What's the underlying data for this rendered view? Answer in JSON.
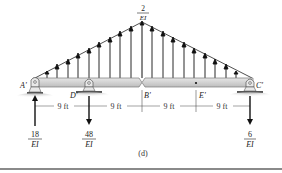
{
  "figure": {
    "caption": "(d)",
    "peak_label": {
      "num": "2",
      "den": "EI"
    },
    "points": [
      {
        "id": "A",
        "label": "A'"
      },
      {
        "id": "D",
        "label": "D'"
      },
      {
        "id": "B",
        "label": "B'"
      },
      {
        "id": "E",
        "label": "E'"
      },
      {
        "id": "C",
        "label": "C'"
      }
    ],
    "dimensions": [
      "9 ft",
      "9 ft",
      "9 ft",
      "9 ft"
    ],
    "reactions": [
      {
        "at": "A",
        "direction": "up",
        "num": "18",
        "den": "EI"
      },
      {
        "at": "D",
        "direction": "down",
        "num": "48",
        "den": "EI"
      },
      {
        "at": "C",
        "direction": "down",
        "num": "6",
        "den": "EI"
      }
    ],
    "colors": {
      "beam_fill": "#d4d4d4",
      "beam_stroke": "#7a7a7a",
      "ink": "#111111",
      "ground": "#8a8a8a"
    }
  }
}
